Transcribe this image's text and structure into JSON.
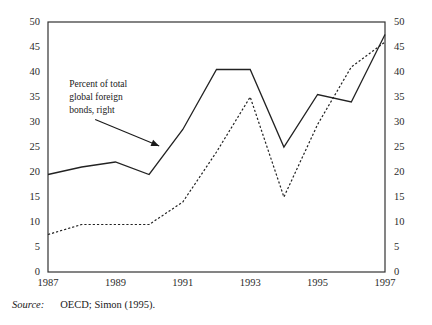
{
  "figure": {
    "source_label": "Source:",
    "source_text": "OECD; Simon (1995).",
    "annotation_line1": "Percent of total",
    "annotation_line2": "global foreign",
    "annotation_line3": "bonds, right",
    "line_color": "#222222",
    "axis_color": "#333333",
    "background": "#ffffff"
  },
  "chart_data": {
    "type": "line",
    "title": "",
    "xlabel": "",
    "ylabel": "",
    "xlim": [
      1987,
      1997
    ],
    "ylim": [
      0,
      50
    ],
    "y_ticks": [
      0,
      5,
      10,
      15,
      20,
      25,
      30,
      35,
      40,
      45,
      50
    ],
    "y_tick_labels": [
      "0",
      "5",
      "10",
      "15",
      "20",
      "25",
      "30",
      "35",
      "40",
      "45",
      "50"
    ],
    "y_axis_right_ticks": [
      0,
      5,
      10,
      15,
      20,
      25,
      30,
      35,
      40,
      45,
      50
    ],
    "y_axis_right_tick_labels": [
      "0",
      "5",
      "10",
      "15",
      "20",
      "25",
      "30",
      "35",
      "40",
      "45",
      "50"
    ],
    "x_ticks": [
      1987,
      1989,
      1991,
      1993,
      1995,
      1997
    ],
    "x_tick_labels": [
      "1987",
      "1989",
      "1991",
      "1993",
      "1995",
      "1997"
    ],
    "grid": false,
    "legend": "none",
    "x": [
      1987,
      1988,
      1989,
      1990,
      1991,
      1992,
      1993,
      1994,
      1995,
      1996,
      1997
    ],
    "series": [
      {
        "name": "solid-series",
        "style": "solid",
        "values": [
          19.5,
          21.0,
          22.0,
          19.5,
          28.5,
          40.5,
          40.5,
          25.0,
          35.5,
          34.0,
          47.5
        ]
      },
      {
        "name": "dotted-series",
        "style": "dotted",
        "values": [
          7.5,
          9.5,
          9.5,
          9.5,
          14.0,
          24.0,
          35.0,
          15.0,
          29.5,
          41.0,
          46.0
        ]
      }
    ],
    "annotations": [
      {
        "text": "Percent of total global foreign bonds, right",
        "arrow_from": [
          1988.4,
          30.5
        ],
        "arrow_to": [
          1990.3,
          25.2
        ]
      }
    ]
  }
}
